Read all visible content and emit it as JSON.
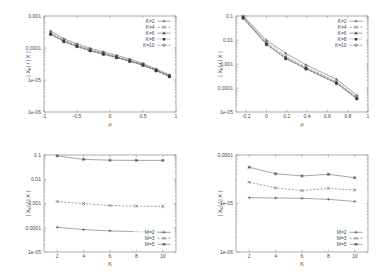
{
  "figure": {
    "panel_count": 4,
    "ylabel_common": "| X",
    "ylabel_sub": "K",
    "ylabel_tail": "| / | X |"
  },
  "chart_data": [
    {
      "panel": "top-left",
      "type": "line",
      "title": "",
      "xlabel": "ρ",
      "ylabel": "| X_K | / | X |",
      "yscale": "log",
      "ylim": [
        1e-06,
        0.001
      ],
      "xlim": [
        -1,
        1
      ],
      "ytick_labels": [
        "0.001",
        "0.0001",
        "1e-05",
        "1e-06"
      ],
      "ytick_values": [
        0.001,
        0.0001,
        1e-05,
        1e-06
      ],
      "xtick_labels": [
        "-1",
        "-0.5",
        "0",
        "0.5",
        "1"
      ],
      "xtick_values": [
        -1,
        -0.5,
        0,
        0.5,
        1
      ],
      "grid": false,
      "legend_position": "top-right",
      "x": [
        -0.9,
        -0.7,
        -0.5,
        -0.3,
        -0.1,
        0.1,
        0.3,
        0.5,
        0.7,
        0.9
      ],
      "series": [
        {
          "name": "K=2",
          "marker": "plus",
          "values": [
            0.00034,
            0.000195,
            0.000135,
            9.8e-05,
            7.6e-05,
            5.9e-05,
            4.5e-05,
            3.3e-05,
            2.2e-05,
            1.45e-05
          ]
        },
        {
          "name": "K=4",
          "marker": "cross",
          "values": [
            0.0003,
            0.000175,
            0.000122,
            8.9e-05,
            6.9e-05,
            5.4e-05,
            4.1e-05,
            3.05e-05,
            2.05e-05,
            1.35e-05
          ]
        },
        {
          "name": "K=6",
          "marker": "star",
          "values": [
            0.00028,
            0.000165,
            0.000115,
            8.4e-05,
            6.6e-05,
            5.15e-05,
            3.95e-05,
            2.95e-05,
            2e-05,
            1.3e-05
          ]
        },
        {
          "name": "K=8",
          "marker": "square",
          "values": [
            0.00027,
            0.00016,
            0.000112,
            8.2e-05,
            6.4e-05,
            5e-05,
            3.85e-05,
            2.9e-05,
            1.95e-05,
            1.28e-05
          ]
        },
        {
          "name": "K=10",
          "marker": "circle",
          "values": [
            0.000265,
            0.000157,
            0.00011,
            8.05e-05,
            6.3e-05,
            4.95e-05,
            3.8e-05,
            2.85e-05,
            1.92e-05,
            1.26e-05
          ]
        }
      ]
    },
    {
      "panel": "top-right",
      "type": "line",
      "title": "",
      "xlabel": "ρ",
      "ylabel": "| X_K | / | X |",
      "yscale": "log",
      "ylim": [
        1e-05,
        0.1
      ],
      "xlim": [
        -0.3,
        1.0
      ],
      "ytick_labels": [
        "0.1",
        "0.01",
        "0.001",
        "0.0001",
        "1e-05"
      ],
      "ytick_values": [
        0.1,
        0.01,
        0.001,
        0.0001,
        1e-05
      ],
      "xtick_labels": [
        "-0.2",
        "0",
        "0.2",
        "0.4",
        "0.6",
        "0.8",
        "1"
      ],
      "xtick_values": [
        -0.2,
        0,
        0.2,
        0.4,
        0.6,
        0.8,
        1
      ],
      "grid": false,
      "legend_position": "top-right",
      "x": [
        -0.23,
        0.0,
        0.19,
        0.39,
        0.69,
        0.89
      ],
      "series": [
        {
          "name": "K=2",
          "marker": "plus",
          "values": [
            0.1,
            0.0098,
            0.0028,
            0.00092,
            0.00023,
            5e-05
          ]
        },
        {
          "name": "K=4",
          "marker": "cross",
          "values": [
            0.092,
            0.0082,
            0.0021,
            0.00074,
            0.000185,
            4.2e-05
          ]
        },
        {
          "name": "K=6",
          "marker": "star",
          "values": [
            0.086,
            0.007,
            0.0018,
            0.00066,
            0.000165,
            3.8e-05
          ]
        },
        {
          "name": "K=8",
          "marker": "square",
          "values": [
            0.083,
            0.0066,
            0.0017,
            0.00063,
            0.000158,
            3.6e-05
          ]
        },
        {
          "name": "K=10",
          "marker": "circle",
          "values": [
            0.081,
            0.0064,
            0.00165,
            0.00061,
            0.000154,
            3.5e-05
          ]
        }
      ]
    },
    {
      "panel": "bottom-left",
      "type": "line",
      "title": "",
      "xlabel": "K",
      "ylabel": "| X_K | / | X |",
      "yscale": "log",
      "ylim": [
        1e-05,
        0.1
      ],
      "xlim": [
        1,
        11
      ],
      "ytick_labels": [
        "0.1",
        "0.01",
        "0.001",
        "0.0001",
        "1e-05"
      ],
      "ytick_values": [
        0.1,
        0.01,
        0.001,
        0.0001,
        1e-05
      ],
      "xtick_labels": [
        "2",
        "4",
        "6",
        "8",
        "10"
      ],
      "xtick_values": [
        2,
        4,
        6,
        8,
        10
      ],
      "grid": false,
      "legend_position": "bottom-right",
      "x": [
        2,
        4,
        6,
        8,
        10
      ],
      "series": [
        {
          "name": "M=2",
          "marker": "plus",
          "values": [
            0.000105,
            8.4e-05,
            7.4e-05,
            6.9e-05,
            6.6e-05
          ]
        },
        {
          "name": "M=3",
          "marker": "cross",
          "values": [
            0.0012,
            0.00099,
            0.00082,
            0.00078,
            0.00076
          ]
        },
        {
          "name": "M=5",
          "marker": "star",
          "values": [
            0.092,
            0.066,
            0.061,
            0.06,
            0.06
          ]
        }
      ]
    },
    {
      "panel": "bottom-right",
      "type": "line",
      "title": "",
      "xlabel": "K",
      "ylabel": "| X_K | / | X |",
      "yscale": "log",
      "ylim": [
        1e-06,
        0.0001
      ],
      "xlim": [
        1,
        11
      ],
      "ytick_labels": [
        "0.0001",
        "1e-05",
        "1e-06"
      ],
      "ytick_values": [
        0.0001,
        1e-05,
        1e-06
      ],
      "xtick_labels": [
        "2",
        "4",
        "6",
        "8",
        "10"
      ],
      "xtick_values": [
        2,
        4,
        6,
        8,
        10
      ],
      "grid": false,
      "legend_position": "bottom-right",
      "x": [
        2,
        4,
        6,
        8,
        10
      ],
      "series": [
        {
          "name": "M=2",
          "marker": "plus",
          "values": [
            1.32e-05,
            1.3e-05,
            1.28e-05,
            1.22e-05,
            1.1e-05
          ]
        },
        {
          "name": "M=3",
          "marker": "cross",
          "values": [
            2.75e-05,
            2.1e-05,
            1.85e-05,
            2.05e-05,
            1.9e-05
          ]
        },
        {
          "name": "M=5",
          "marker": "star",
          "values": [
            5.6e-05,
            4.1e-05,
            3.7e-05,
            4e-05,
            3.4e-05
          ]
        }
      ]
    }
  ]
}
